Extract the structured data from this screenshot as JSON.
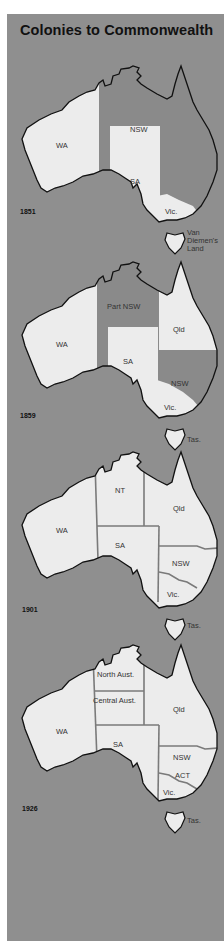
{
  "title": "Colonies to Commonwealth",
  "colors": {
    "background": "#8f8f8f",
    "land_light": "#ececec",
    "land_dark": "#8a8a8a",
    "border": "#7a7a7a",
    "coast": "#111111"
  },
  "maps": [
    {
      "year": "1851",
      "regions": {
        "wa": "WA",
        "nsw": "NSW",
        "sa": "SA",
        "vic": "Vic."
      },
      "tasmania": [
        "Van",
        "Diemen's",
        "Land"
      ]
    },
    {
      "year": "1859",
      "regions": {
        "wa": "WA",
        "part_nsw": "Part NSW",
        "qld": "Qld",
        "sa": "SA",
        "nsw": "NSW",
        "vic": "Vic."
      },
      "tasmania": "Tas."
    },
    {
      "year": "1901",
      "regions": {
        "wa": "WA",
        "nt": "NT",
        "qld": "Qld",
        "sa": "SA",
        "nsw": "NSW",
        "vic": "Vic."
      },
      "tasmania": "Tas."
    },
    {
      "year": "1926",
      "regions": {
        "wa": "WA",
        "north": "North Aust.",
        "central": "Central Aust.",
        "qld": "Qld",
        "sa": "SA",
        "nsw": "NSW",
        "act": "ACT",
        "vic": "Vic."
      },
      "tasmania": "Tas."
    }
  ]
}
